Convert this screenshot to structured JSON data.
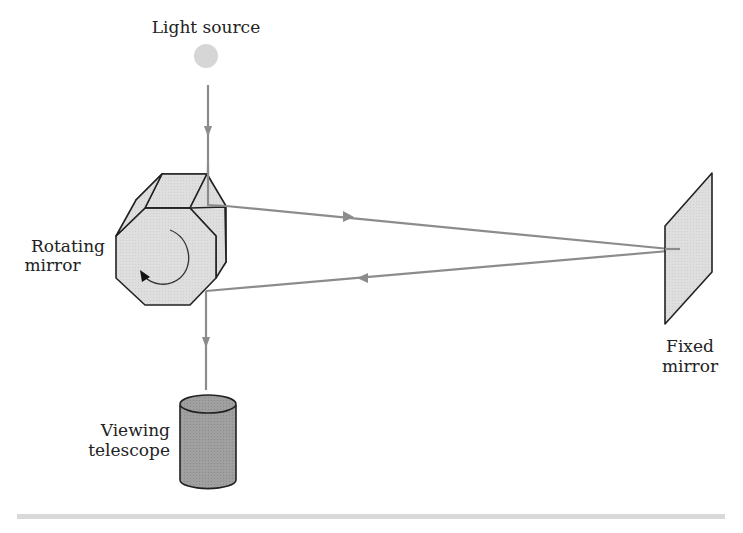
{
  "diagram": {
    "type": "experimental-setup",
    "labels": {
      "light_source": "Light source",
      "rotating_mirror_line1": "Rotating",
      "rotating_mirror_line2": "mirror",
      "fixed_mirror_line1": "Fixed",
      "fixed_mirror_line2": "mirror",
      "telescope_line1": "Viewing",
      "telescope_line2": "telescope"
    },
    "colors": {
      "beam": "#8c8c8c",
      "mirror_fill": "#dcdcdc",
      "outline": "#222222",
      "telescope_fill": "#9a9a9a",
      "light_source": "#d6d6d6",
      "rule": "#d9d9d9"
    },
    "nodes": [
      {
        "id": "light-source",
        "label": "Light source"
      },
      {
        "id": "rotating-mirror",
        "label": "Rotating mirror"
      },
      {
        "id": "fixed-mirror",
        "label": "Fixed mirror"
      },
      {
        "id": "viewing-telescope",
        "label": "Viewing telescope"
      }
    ],
    "edges": [
      {
        "from": "light-source",
        "to": "rotating-mirror",
        "direction": "down"
      },
      {
        "from": "rotating-mirror",
        "to": "fixed-mirror",
        "direction": "right"
      },
      {
        "from": "fixed-mirror",
        "to": "rotating-mirror",
        "direction": "left"
      },
      {
        "from": "rotating-mirror",
        "to": "viewing-telescope",
        "direction": "down"
      }
    ]
  }
}
